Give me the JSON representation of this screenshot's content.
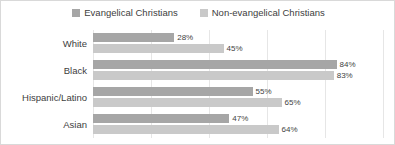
{
  "chart_data": {
    "type": "bar",
    "orientation": "horizontal",
    "title": "",
    "subtitle": "",
    "xlabel": "",
    "ylabel": "",
    "xlim": [
      0,
      100
    ],
    "grid": true,
    "grid_axis": "x",
    "gridline_values": [
      0,
      20,
      40,
      60,
      80,
      100
    ],
    "legend_position": "top-center",
    "value_suffix": "%",
    "categories": [
      "White",
      "Black",
      "Hispanic/Latino",
      "Asian"
    ],
    "series": [
      {
        "name": "Evangelical Christians",
        "color": "#a6a6a6",
        "values": [
          28,
          84,
          55,
          47
        ],
        "labels": [
          "28%",
          "84%",
          "55%",
          "47%"
        ]
      },
      {
        "name": "Non-evangelical Christians",
        "color": "#c9c9c9",
        "values": [
          45,
          83,
          65,
          64
        ],
        "labels": [
          "45%",
          "83%",
          "65%",
          "64%"
        ]
      }
    ]
  },
  "legend": {
    "entries": [
      {
        "label": "Evangelical Christians",
        "color": "#a6a6a6"
      },
      {
        "label": "Non-evangelical Christians",
        "color": "#c9c9c9"
      }
    ]
  },
  "colors": {
    "series_evangelical": "#a6a6a6",
    "series_non_evangelical": "#c9c9c9",
    "gridline": "#e6e6e6",
    "text": "#404040",
    "data_label": "#3f3f3f",
    "background": "#ffffff",
    "frame": "#d9d9d9"
  }
}
